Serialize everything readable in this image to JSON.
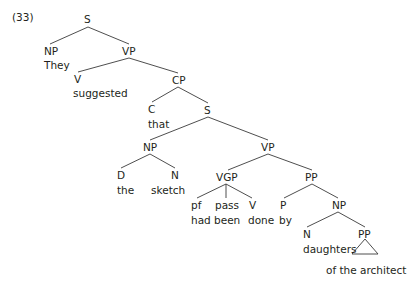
{
  "example_number": "(33)",
  "nodes": {
    "s_root": "S",
    "np_subj": "NP",
    "they": "They",
    "vp_main": "VP",
    "v_main": "V",
    "suggested": "suggested",
    "cp": "CP",
    "c": "C",
    "that": "that",
    "s_emb": "S",
    "np_emb": "NP",
    "d": "D",
    "the": "the",
    "n_emb": "N",
    "sketch": "sketch",
    "vp_emb": "VP",
    "vgp": "VGP",
    "pf": "pf",
    "had": "had",
    "pass": "pass",
    "been": "been",
    "v_emb": "V",
    "done": "done",
    "pp": "PP",
    "p": "P",
    "by": "by",
    "np_obj": "NP",
    "n_obj": "N",
    "daughters": "daughters",
    "pp_inner": "PP",
    "of_the_architect": "of the architect"
  },
  "colors": {
    "ink": "#231f20",
    "line": "#3a3a3a",
    "background": "#ffffff"
  }
}
